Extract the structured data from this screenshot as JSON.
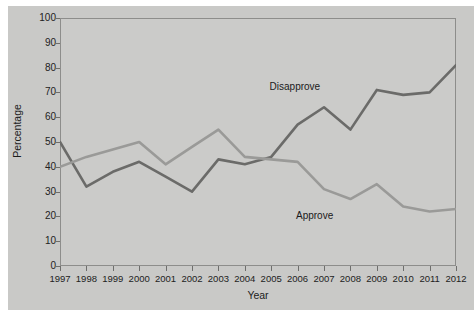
{
  "chart_data": {
    "type": "line",
    "title": "",
    "xlabel": "Year",
    "ylabel": "Percentage",
    "xlim": [
      1997,
      2012
    ],
    "ylim": [
      0,
      100
    ],
    "ytick_step": 10,
    "grid": false,
    "legend_position": "inline-annotations",
    "x": [
      1997,
      1998,
      1999,
      2000,
      2001,
      2002,
      2003,
      2004,
      2005,
      2006,
      2007,
      2008,
      2009,
      2010,
      2011,
      2012
    ],
    "xtick_labels": [
      "1997",
      "1998",
      "1999",
      "2000",
      "2001",
      "2002",
      "2003",
      "2004",
      "2005",
      "2006",
      "2007",
      "2008",
      "2009",
      "2010",
      "2011",
      "2012"
    ],
    "ytick_labels": [
      "0",
      "10",
      "20",
      "30",
      "40",
      "50",
      "60",
      "70",
      "80",
      "90",
      "100"
    ],
    "series": [
      {
        "name": "Disapprove",
        "color": "#6b6b69",
        "values": [
          50,
          32,
          38,
          42,
          36,
          30,
          43,
          41,
          44,
          57,
          64,
          55,
          71,
          69,
          70,
          81
        ]
      },
      {
        "name": "Approve",
        "color": "#9a9a98",
        "values": [
          40,
          44,
          47,
          50,
          41,
          48,
          55,
          44,
          43,
          42,
          31,
          27,
          33,
          24,
          22,
          23
        ]
      }
    ],
    "annotations": [
      {
        "text": "Disapprove",
        "x": 2006,
        "y": 72
      },
      {
        "text": "Approve",
        "x": 2007,
        "y": 20
      }
    ]
  },
  "figure": {
    "background_color": "#c9c9c7",
    "plot_background_color": "#cbcbc9",
    "frame_color": "#8d8d8b"
  }
}
